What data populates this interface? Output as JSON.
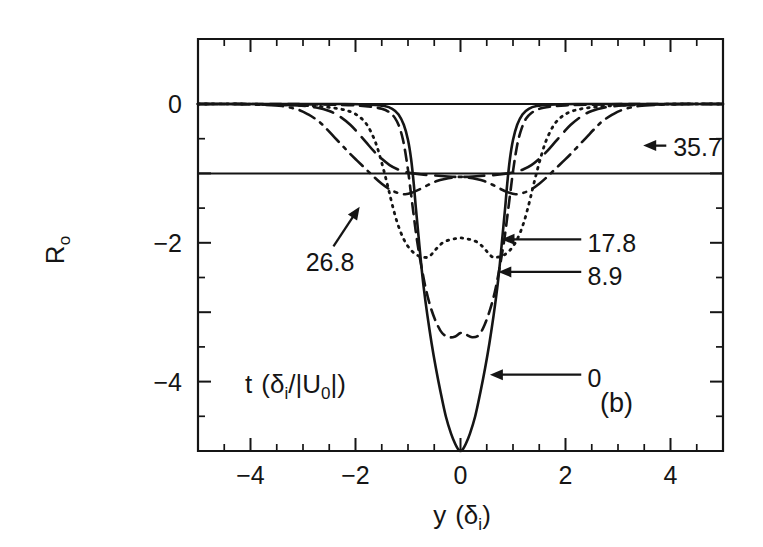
{
  "figure": {
    "panel_label": "(b)",
    "background_color": "#ffffff",
    "ink_color": "#151515"
  },
  "chart_data": {
    "type": "line",
    "title": "",
    "subtitle": "",
    "xlabel": "y (δi)",
    "xlabel_parts": {
      "main": "y",
      "paren_open": "(",
      "symbol": "δ",
      "sub": "i",
      "paren_close": ")"
    },
    "ylabel": "Ro",
    "ylabel_parts": {
      "main": "R",
      "sub": "o"
    },
    "legend_title": "t (δi/|U0|)",
    "legend_title_parts": {
      "t": "t",
      "open": "(",
      "delta": "δ",
      "deltasub": "i",
      "slash": "/",
      "bar1": "|",
      "u": "U",
      "usub": "0",
      "bar2": "|",
      "close": ")"
    },
    "legend_position": "inside-plot-lower-left",
    "grid": false,
    "xlim": [
      -5,
      5
    ],
    "ylim": [
      -5,
      0.45
    ],
    "xticks_major": [
      -4,
      -2,
      0,
      2,
      4
    ],
    "xticks_major_labels": [
      "−4",
      "−2",
      "0",
      "2",
      "4"
    ],
    "xtick_minor_step": 0.5,
    "yticks_major": [
      0,
      -2,
      -4
    ],
    "yticks_major_labels": [
      "0",
      "−2",
      "−4"
    ],
    "yticks_all_major": [
      0,
      -1,
      -2,
      -3,
      -4,
      -5
    ],
    "ytick_minor_step": 0.5,
    "reference_lines": [
      {
        "name": "zero-level",
        "y": 0.0,
        "style": "solid"
      },
      {
        "name": "minus-one-level",
        "y": -1.0,
        "style": "solid"
      }
    ],
    "series": [
      {
        "name": "0",
        "label": "0",
        "style": "solid",
        "points": [
          [
            -5.0,
            0.0
          ],
          [
            -4.0,
            0.0
          ],
          [
            -3.0,
            0.0
          ],
          [
            -2.2,
            0.0
          ],
          [
            -1.7,
            -0.01
          ],
          [
            -1.45,
            -0.03
          ],
          [
            -1.3,
            -0.07
          ],
          [
            -1.18,
            -0.15
          ],
          [
            -1.08,
            -0.3
          ],
          [
            -1.0,
            -0.52
          ],
          [
            -0.94,
            -0.8
          ],
          [
            -0.89,
            -1.15
          ],
          [
            -0.85,
            -1.5
          ],
          [
            -0.8,
            -1.9
          ],
          [
            -0.75,
            -2.3
          ],
          [
            -0.7,
            -2.65
          ],
          [
            -0.63,
            -3.05
          ],
          [
            -0.55,
            -3.45
          ],
          [
            -0.47,
            -3.8
          ],
          [
            -0.38,
            -4.15
          ],
          [
            -0.28,
            -4.5
          ],
          [
            -0.18,
            -4.75
          ],
          [
            -0.1,
            -4.9
          ],
          [
            -0.04,
            -4.98
          ],
          [
            0.0,
            -5.0
          ],
          [
            0.04,
            -4.98
          ],
          [
            0.1,
            -4.9
          ],
          [
            0.18,
            -4.75
          ],
          [
            0.28,
            -4.5
          ],
          [
            0.38,
            -4.15
          ],
          [
            0.47,
            -3.8
          ],
          [
            0.55,
            -3.45
          ],
          [
            0.63,
            -3.05
          ],
          [
            0.7,
            -2.65
          ],
          [
            0.75,
            -2.3
          ],
          [
            0.8,
            -1.9
          ],
          [
            0.85,
            -1.5
          ],
          [
            0.89,
            -1.15
          ],
          [
            0.94,
            -0.8
          ],
          [
            1.0,
            -0.52
          ],
          [
            1.08,
            -0.3
          ],
          [
            1.18,
            -0.15
          ],
          [
            1.3,
            -0.07
          ],
          [
            1.45,
            -0.03
          ],
          [
            1.7,
            -0.01
          ],
          [
            2.2,
            0.0
          ],
          [
            3.0,
            0.0
          ],
          [
            4.0,
            0.0
          ],
          [
            5.0,
            0.0
          ]
        ]
      },
      {
        "name": "8.9",
        "label": "8.9",
        "style": "dashed",
        "points": [
          [
            -5.0,
            0.0
          ],
          [
            -4.0,
            0.0
          ],
          [
            -3.2,
            0.0
          ],
          [
            -2.5,
            -0.01
          ],
          [
            -2.0,
            -0.02
          ],
          [
            -1.7,
            -0.04
          ],
          [
            -1.5,
            -0.07
          ],
          [
            -1.35,
            -0.12
          ],
          [
            -1.25,
            -0.2
          ],
          [
            -1.17,
            -0.32
          ],
          [
            -1.1,
            -0.5
          ],
          [
            -1.05,
            -0.7
          ],
          [
            -1.0,
            -0.95
          ],
          [
            -0.95,
            -1.25
          ],
          [
            -0.9,
            -1.55
          ],
          [
            -0.85,
            -1.85
          ],
          [
            -0.8,
            -2.1
          ],
          [
            -0.73,
            -2.4
          ],
          [
            -0.65,
            -2.7
          ],
          [
            -0.56,
            -2.95
          ],
          [
            -0.46,
            -3.15
          ],
          [
            -0.35,
            -3.3
          ],
          [
            -0.22,
            -3.36
          ],
          [
            -0.1,
            -3.35
          ],
          [
            0.0,
            -3.3
          ],
          [
            0.1,
            -3.32
          ],
          [
            0.22,
            -3.36
          ],
          [
            0.35,
            -3.33
          ],
          [
            0.46,
            -3.18
          ],
          [
            0.56,
            -2.97
          ],
          [
            0.65,
            -2.72
          ],
          [
            0.73,
            -2.42
          ],
          [
            0.8,
            -2.12
          ],
          [
            0.85,
            -1.87
          ],
          [
            0.9,
            -1.57
          ],
          [
            0.95,
            -1.27
          ],
          [
            1.0,
            -0.97
          ],
          [
            1.05,
            -0.72
          ],
          [
            1.1,
            -0.52
          ],
          [
            1.17,
            -0.34
          ],
          [
            1.25,
            -0.21
          ],
          [
            1.35,
            -0.13
          ],
          [
            1.5,
            -0.07
          ],
          [
            1.7,
            -0.04
          ],
          [
            2.0,
            -0.02
          ],
          [
            2.5,
            -0.01
          ],
          [
            3.2,
            0.0
          ],
          [
            4.0,
            0.0
          ],
          [
            5.0,
            0.0
          ]
        ]
      },
      {
        "name": "17.8",
        "label": "17.8",
        "style": "dotted",
        "points": [
          [
            -5.0,
            0.0
          ],
          [
            -4.2,
            0.0
          ],
          [
            -3.5,
            -0.01
          ],
          [
            -3.0,
            -0.02
          ],
          [
            -2.6,
            -0.04
          ],
          [
            -2.3,
            -0.07
          ],
          [
            -2.1,
            -0.11
          ],
          [
            -1.95,
            -0.17
          ],
          [
            -1.82,
            -0.26
          ],
          [
            -1.72,
            -0.38
          ],
          [
            -1.62,
            -0.55
          ],
          [
            -1.54,
            -0.74
          ],
          [
            -1.46,
            -0.96
          ],
          [
            -1.38,
            -1.2
          ],
          [
            -1.3,
            -1.45
          ],
          [
            -1.2,
            -1.72
          ],
          [
            -1.08,
            -1.95
          ],
          [
            -0.95,
            -2.1
          ],
          [
            -0.82,
            -2.18
          ],
          [
            -0.68,
            -2.21
          ],
          [
            -0.6,
            -2.2
          ],
          [
            -0.52,
            -2.14
          ],
          [
            -0.44,
            -2.07
          ],
          [
            -0.34,
            -2.0
          ],
          [
            -0.22,
            -1.96
          ],
          [
            -0.1,
            -1.94
          ],
          [
            0.0,
            -1.93
          ],
          [
            0.1,
            -1.94
          ],
          [
            0.22,
            -1.96
          ],
          [
            0.34,
            -2.0
          ],
          [
            0.44,
            -2.07
          ],
          [
            0.52,
            -2.14
          ],
          [
            0.6,
            -2.2
          ],
          [
            0.68,
            -2.21
          ],
          [
            0.82,
            -2.18
          ],
          [
            0.95,
            -2.1
          ],
          [
            1.08,
            -1.95
          ],
          [
            1.2,
            -1.72
          ],
          [
            1.3,
            -1.45
          ],
          [
            1.38,
            -1.2
          ],
          [
            1.46,
            -0.96
          ],
          [
            1.54,
            -0.74
          ],
          [
            1.62,
            -0.55
          ],
          [
            1.72,
            -0.38
          ],
          [
            1.82,
            -0.26
          ],
          [
            1.95,
            -0.17
          ],
          [
            2.1,
            -0.11
          ],
          [
            2.3,
            -0.07
          ],
          [
            2.6,
            -0.04
          ],
          [
            3.0,
            -0.02
          ],
          [
            3.5,
            -0.01
          ],
          [
            4.2,
            0.0
          ],
          [
            5.0,
            0.0
          ]
        ]
      },
      {
        "name": "26.8",
        "label": "26.8",
        "style": "longdash",
        "points": [
          [
            -5.0,
            0.0
          ],
          [
            -4.2,
            0.0
          ],
          [
            -3.6,
            -0.01
          ],
          [
            -3.1,
            -0.02
          ],
          [
            -2.75,
            -0.05
          ],
          [
            -2.5,
            -0.1
          ],
          [
            -2.3,
            -0.18
          ],
          [
            -2.1,
            -0.3
          ],
          [
            -1.95,
            -0.42
          ],
          [
            -1.8,
            -0.55
          ],
          [
            -1.65,
            -0.68
          ],
          [
            -1.5,
            -0.79
          ],
          [
            -1.35,
            -0.88
          ],
          [
            -1.2,
            -0.94
          ],
          [
            -1.05,
            -0.98
          ],
          [
            -0.9,
            -1.0
          ],
          [
            -0.7,
            -1.02
          ],
          [
            -0.5,
            -1.03
          ],
          [
            -0.3,
            -1.04
          ],
          [
            -0.1,
            -1.05
          ],
          [
            0.1,
            -1.05
          ],
          [
            0.3,
            -1.04
          ],
          [
            0.5,
            -1.03
          ],
          [
            0.7,
            -1.02
          ],
          [
            0.9,
            -1.0
          ],
          [
            1.05,
            -0.98
          ],
          [
            1.2,
            -0.94
          ],
          [
            1.35,
            -0.88
          ],
          [
            1.5,
            -0.79
          ],
          [
            1.65,
            -0.68
          ],
          [
            1.8,
            -0.55
          ],
          [
            1.95,
            -0.42
          ],
          [
            2.1,
            -0.3
          ],
          [
            2.3,
            -0.18
          ],
          [
            2.5,
            -0.1
          ],
          [
            2.75,
            -0.05
          ],
          [
            3.1,
            -0.02
          ],
          [
            3.6,
            -0.01
          ],
          [
            4.2,
            0.0
          ],
          [
            5.0,
            0.0
          ]
        ]
      },
      {
        "name": "35.7",
        "label": "35.7",
        "style": "dashdot",
        "points": [
          [
            -5.0,
            0.0
          ],
          [
            -4.3,
            0.0
          ],
          [
            -3.8,
            -0.01
          ],
          [
            -3.4,
            -0.03
          ],
          [
            -3.1,
            -0.08
          ],
          [
            -2.9,
            -0.15
          ],
          [
            -2.7,
            -0.25
          ],
          [
            -2.55,
            -0.36
          ],
          [
            -2.4,
            -0.48
          ],
          [
            -2.25,
            -0.6
          ],
          [
            -2.1,
            -0.72
          ],
          [
            -1.95,
            -0.83
          ],
          [
            -1.8,
            -0.94
          ],
          [
            -1.65,
            -1.05
          ],
          [
            -1.5,
            -1.15
          ],
          [
            -1.35,
            -1.23
          ],
          [
            -1.2,
            -1.28
          ],
          [
            -1.05,
            -1.3
          ],
          [
            -0.9,
            -1.27
          ],
          [
            -0.75,
            -1.22
          ],
          [
            -0.6,
            -1.16
          ],
          [
            -0.45,
            -1.11
          ],
          [
            -0.3,
            -1.08
          ],
          [
            -0.15,
            -1.06
          ],
          [
            0.0,
            -1.05
          ],
          [
            0.15,
            -1.06
          ],
          [
            0.3,
            -1.08
          ],
          [
            0.45,
            -1.11
          ],
          [
            0.6,
            -1.16
          ],
          [
            0.75,
            -1.22
          ],
          [
            0.9,
            -1.27
          ],
          [
            1.05,
            -1.3
          ],
          [
            1.2,
            -1.28
          ],
          [
            1.35,
            -1.23
          ],
          [
            1.5,
            -1.15
          ],
          [
            1.65,
            -1.05
          ],
          [
            1.8,
            -0.94
          ],
          [
            1.95,
            -0.83
          ],
          [
            2.1,
            -0.72
          ],
          [
            2.25,
            -0.6
          ],
          [
            2.4,
            -0.48
          ],
          [
            2.55,
            -0.36
          ],
          [
            2.7,
            -0.25
          ],
          [
            2.9,
            -0.15
          ],
          [
            3.1,
            -0.08
          ],
          [
            3.4,
            -0.03
          ],
          [
            3.8,
            -0.01
          ],
          [
            4.3,
            0.0
          ],
          [
            5.0,
            0.0
          ]
        ]
      }
    ],
    "annotations": [
      {
        "name": "label-35-7",
        "text": "35.7",
        "text_x": 4.05,
        "text_y": -0.62,
        "arrow_type": "horizontal",
        "arrow_from_x": 3.92,
        "arrow_to_x": 3.48,
        "arrow_y": -0.6
      },
      {
        "name": "label-17-8",
        "text": "17.8",
        "text_x": 2.42,
        "text_y": -2.0,
        "arrow_type": "horizontal",
        "arrow_from_x": 2.3,
        "arrow_to_x": 0.78,
        "arrow_y": -1.95
      },
      {
        "name": "label-8-9",
        "text": "8.9",
        "text_x": 2.42,
        "text_y": -2.48,
        "arrow_type": "horizontal",
        "arrow_from_x": 2.3,
        "arrow_to_x": 0.72,
        "arrow_y": -2.42
      },
      {
        "name": "label-0",
        "text": "0",
        "text_x": 2.42,
        "text_y": -3.95,
        "arrow_type": "horizontal",
        "arrow_from_x": 2.3,
        "arrow_to_x": 0.56,
        "arrow_y": -3.9
      },
      {
        "name": "label-26-8",
        "text": "26.8",
        "text_x": -2.95,
        "text_y": -2.28,
        "arrow_type": "diagonal",
        "arrow_from_x": -2.42,
        "arrow_from_y": -2.05,
        "arrow_to_x": -1.92,
        "arrow_to_y": -1.48
      }
    ]
  }
}
